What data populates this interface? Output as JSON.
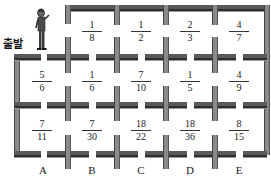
{
  "start": {
    "label": "출발"
  },
  "columns": [
    "A",
    "B",
    "C",
    "D",
    "E"
  ],
  "grid": [
    [
      null,
      {
        "num": "1",
        "den": "8"
      },
      {
        "num": "1",
        "den": "2"
      },
      {
        "num": "2",
        "den": "3"
      },
      {
        "num": "4",
        "den": "7"
      }
    ],
    [
      {
        "num": "5",
        "den": "6"
      },
      {
        "num": "1",
        "den": "6"
      },
      {
        "num": "7",
        "den": "10"
      },
      {
        "num": "1",
        "den": "5"
      },
      {
        "num": "4",
        "den": "9"
      }
    ],
    [
      {
        "num": "7",
        "den": "11"
      },
      {
        "num": "7",
        "den": "30"
      },
      {
        "num": "18",
        "den": "22"
      },
      {
        "num": "18",
        "den": "36"
      },
      {
        "num": "8",
        "den": "15"
      }
    ]
  ],
  "cells": {
    "r0c1": {
      "num": "1",
      "den": "8"
    },
    "r0c2": {
      "num": "1",
      "den": "2"
    },
    "r0c3": {
      "num": "2",
      "den": "3"
    },
    "r0c4": {
      "num": "4",
      "den": "7"
    },
    "r1c0": {
      "num": "5",
      "den": "6"
    },
    "r1c1": {
      "num": "1",
      "den": "6"
    },
    "r1c2": {
      "num": "7",
      "den": "10"
    },
    "r1c3": {
      "num": "1",
      "den": "5"
    },
    "r1c4": {
      "num": "4",
      "den": "9"
    },
    "r2c0": {
      "num": "7",
      "den": "11"
    },
    "r2c1": {
      "num": "7",
      "den": "30"
    },
    "r2c2": {
      "num": "18",
      "den": "22"
    },
    "r2c3": {
      "num": "18",
      "den": "36"
    },
    "r2c4": {
      "num": "8",
      "den": "15"
    }
  },
  "colors": {
    "wall_dark": "#2e2e2e",
    "wall_mid": "#5a5a5a",
    "wall_side": "#8a8a8a",
    "text": "#222222"
  }
}
